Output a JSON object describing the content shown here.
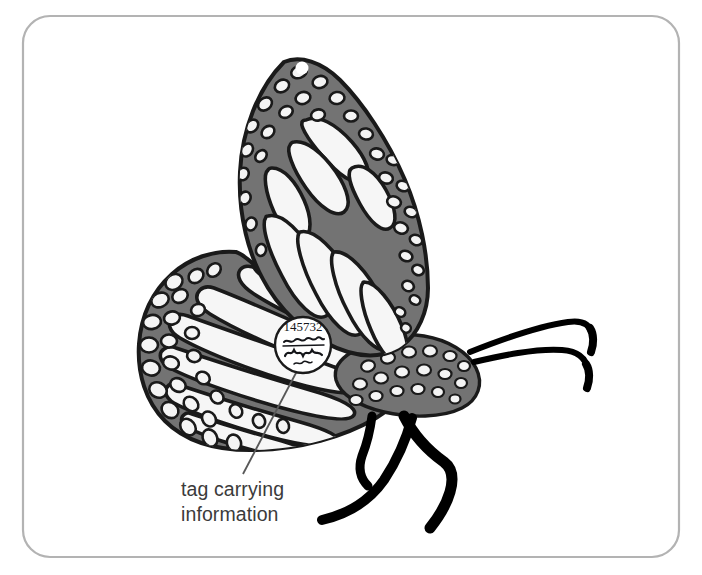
{
  "figure": {
    "frame": {
      "shape": "rounded-rectangle",
      "stroke_color": "#b3b3b3",
      "fill_color": "#ffffff",
      "corner_radius": 26
    },
    "background_color": "#ffffff"
  },
  "colors": {
    "wing_fill": "#737373",
    "wing_outline": "#1a1a1a",
    "spot_fill": "#f4f4f4",
    "cell_fill": "#f6f6f6",
    "body_fill": "#737373",
    "leg_color": "#000000",
    "antenna_color": "#000000",
    "tag_fill": "#ffffff",
    "tag_outline": "#1a1a1a",
    "leader_line": "#585858",
    "caption_color": "#3b3b3b"
  },
  "tag": {
    "name": "butterfly-wing-tag",
    "shape": "circle",
    "number": "145732",
    "handwriting_line_1": "Monarch Watch",
    "handwriting_line_2": "AXYT4L",
    "handwriting_line_3": "~~~~",
    "description": "white circular sticker tag affixed to the hindwing"
  },
  "callout": {
    "label_line_1": "tag carrying",
    "label_line_2": "information",
    "leader_from": "tag",
    "leader_to": "caption"
  },
  "anatomy": {
    "forewing": "upper wing with white cell spots and marginal dots",
    "hindwing": "lower rounded wing with radiating veins and scalloped spotted margin",
    "body": "gray thorax and abdomen with white spots",
    "antennae_count": 2,
    "legs_count": 3
  }
}
